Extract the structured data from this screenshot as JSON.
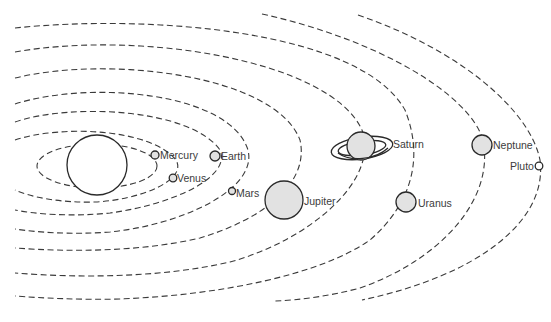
{
  "colors": {
    "planet_fill": "#e2e2e2",
    "sun_fill": "#ffffff",
    "stroke": "#2a2a2a",
    "orbit": "#3a3a3a",
    "label": "#3c3c3c"
  },
  "sun": {
    "name": "Sun",
    "cx": 97,
    "cy": 165,
    "r": 30
  },
  "planets": [
    {
      "name": "Mercury",
      "label": "Mercury",
      "cx": 155,
      "cy": 155,
      "r": 4,
      "label_x": 160,
      "label_y": 149
    },
    {
      "name": "Venus",
      "label": "Venus",
      "cx": 173,
      "cy": 178,
      "r": 3.8,
      "label_x": 177,
      "label_y": 173
    },
    {
      "name": "Earth",
      "label": "Earth",
      "cx": 215,
      "cy": 156,
      "r": 5,
      "label_x": 221,
      "label_y": 150
    },
    {
      "name": "Mars",
      "label": "Mars",
      "cx": 232,
      "cy": 191,
      "r": 3.5,
      "label_x": 236,
      "label_y": 188
    },
    {
      "name": "Jupiter",
      "label": "Jupiter",
      "cx": 284,
      "cy": 200,
      "r": 19,
      "label_x": 304,
      "label_y": 196
    },
    {
      "name": "Saturn",
      "label": "Saturn",
      "cx": 361,
      "cy": 146,
      "r": 14,
      "label_x": 393,
      "label_y": 139
    },
    {
      "name": "Uranus",
      "label": "Uranus",
      "cx": 406,
      "cy": 202,
      "r": 10,
      "label_x": 418,
      "label_y": 198
    },
    {
      "name": "Neptune",
      "label": "Neptune",
      "cx": 482,
      "cy": 145,
      "r": 10,
      "label_x": 493,
      "label_y": 140
    },
    {
      "name": "Pluto",
      "label": "Pluto",
      "cx": 539,
      "cy": 166,
      "r": 3.8,
      "label_x": 510,
      "label_y": 161
    }
  ]
}
